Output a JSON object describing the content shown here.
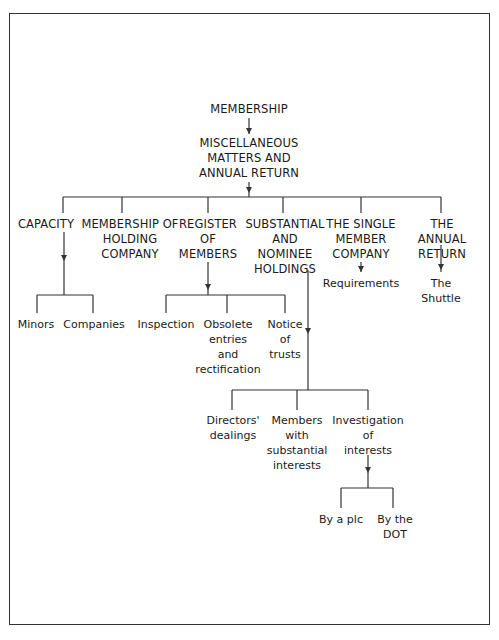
{
  "diagram": {
    "root": {
      "label": "MEMBERSHIP"
    },
    "level1": {
      "label": "MISCELLANEOUS\nMATTERS AND\nANNUAL RETURN"
    },
    "branches": [
      {
        "label": "CAPACITY",
        "children": [
          {
            "label": "Minors"
          },
          {
            "label": "Companies"
          }
        ]
      },
      {
        "label": "MEMBERSHIP OF\nHOLDING\nCOMPANY",
        "children": []
      },
      {
        "label": "REGISTER\nOF\nMEMBERS",
        "children": [
          {
            "label": "Inspection"
          },
          {
            "label": "Obsolete\nentries\nand\nrectification"
          },
          {
            "label": "Notice\nof\ntrusts"
          }
        ]
      },
      {
        "label": "SUBSTANTIAL\nAND\nNOMINEE\nHOLDINGS",
        "children": [
          {
            "label": "Directors'\ndealings"
          },
          {
            "label": "Members\nwith\nsubstantial\ninterests"
          },
          {
            "label": "Investigation\nof\ninterests",
            "children": [
              {
                "label": "By a plc"
              },
              {
                "label": "By the\nDOT"
              }
            ]
          }
        ]
      },
      {
        "label": "THE SINGLE\nMEMBER\nCOMPANY",
        "children": [
          {
            "label": "Requirements"
          }
        ]
      },
      {
        "label": "THE ANNUAL\nRETURN",
        "children": [
          {
            "label": "The\nShuttle"
          }
        ]
      }
    ]
  },
  "colors": {
    "line": "#333333",
    "text": "#1a1a1a",
    "background": "#ffffff"
  }
}
